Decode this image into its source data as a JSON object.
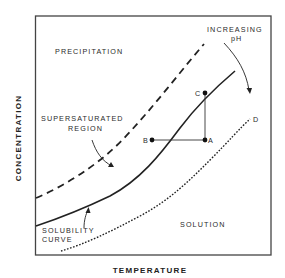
{
  "diagram": {
    "axes": {
      "x_label": "TEMPERATURE",
      "y_label": "CONCENTRATION"
    },
    "regions": {
      "precipitation": "PRECIPITATION",
      "supersaturated_line1": "SUPERSATURATED",
      "supersaturated_line2": "REGION",
      "solution": "SOLUTION"
    },
    "annotations": {
      "solubility_line1": "SOLUBILITY",
      "solubility_line2": "CURVE",
      "increasing_line1": "INCREASING",
      "increasing_line2": "pH"
    },
    "points": {
      "A": "A",
      "B": "B",
      "C": "C",
      "D": "D"
    },
    "curves": [
      {
        "name": "supersaturation-limit",
        "style": "dashed"
      },
      {
        "name": "solubility-curve",
        "style": "solid"
      },
      {
        "name": "solubility-curve-higher-pH",
        "style": "dotted"
      }
    ],
    "colors": {
      "line": "#222222",
      "background": "#ffffff"
    }
  }
}
